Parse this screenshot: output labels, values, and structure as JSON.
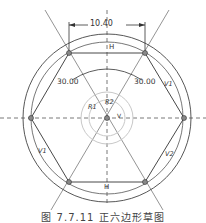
{
  "diagram": {
    "dimension_width": "10.40",
    "angle_left": "30.00",
    "angle_right": "30.00",
    "label_top_constraint": "H",
    "label_bottom_constraint": "H",
    "label_r1": "R1",
    "label_r2": "R2",
    "label_v": "V",
    "label_v1": "V1",
    "label_v2_left": "V1",
    "label_v2_right": "V2",
    "colors": {
      "line": "#333333",
      "construction": "#aaaaaa",
      "light_circle": "#c8c8c8"
    }
  },
  "caption": "图 7.7.11  正六边形草图"
}
